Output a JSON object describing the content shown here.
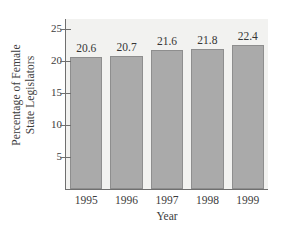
{
  "chart_data": {
    "type": "bar",
    "title": "",
    "xlabel": "Year",
    "ylabel_line1": "Percentage of Female",
    "ylabel_line2": "State Legislators",
    "categories": [
      "1995",
      "1996",
      "1997",
      "1998",
      "1999"
    ],
    "values": [
      20.6,
      20.7,
      21.6,
      21.8,
      22.4
    ],
    "value_labels": [
      "20.6",
      "20.7",
      "21.6",
      "21.8",
      "22.4"
    ],
    "ylim": [
      0,
      26.5
    ],
    "yticks": [
      5,
      10,
      15,
      20,
      25
    ],
    "ytick_labels": [
      "5",
      "10",
      "15",
      "20",
      "25"
    ],
    "grid": false,
    "legend": "none",
    "colors": {
      "bar_fill": "#aaaaaa",
      "bar_edge": "#8e8e8e",
      "plot_background": "#f2f2f0",
      "figure_background": "#ffffff",
      "axis": "#6f6f6f",
      "text": "#3c3c3c"
    }
  }
}
